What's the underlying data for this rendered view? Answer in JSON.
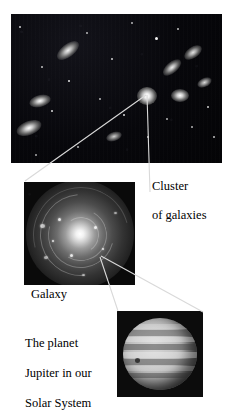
{
  "figure": {
    "type": "nested-zoom-astronomy-diagram",
    "background_color": "#ffffff",
    "panels": [
      {
        "id": "cluster",
        "name": "galaxy-cluster-image",
        "caption": "Cluster\nof galaxies",
        "description": "Dark deep-sky field containing many faint stars and fuzzy elliptical galaxies",
        "background_color": "#050508"
      },
      {
        "id": "galaxy",
        "name": "spiral-galaxy-image",
        "caption": "Galaxy",
        "description": "Face-on spiral galaxy with bright core and winding spiral arms",
        "background_color": "#0a0a0a"
      },
      {
        "id": "jupiter",
        "name": "jupiter-image",
        "caption": "The planet\nJupiter in our\nSolar System",
        "description": "Grayscale disk of Jupiter showing horizontal cloud bands",
        "background_color": "#0c0c0c"
      }
    ]
  },
  "captions": {
    "cluster_line1": "Cluster",
    "cluster_line2": "of galaxies",
    "galaxy": "Galaxy",
    "jupiter_line1": "The planet",
    "jupiter_line2": "Jupiter in our",
    "jupiter_line3": "Solar System"
  },
  "connectors": [
    {
      "name": "cluster-to-galaxy-connector",
      "from": "bright galaxy in cluster field",
      "to": "spiral galaxy panel",
      "color": "#d9d9d9"
    },
    {
      "name": "galaxy-to-jupiter-connector",
      "from": "core of spiral galaxy",
      "to": "jupiter panel",
      "color": "#d9d9d9"
    }
  ],
  "colors": {
    "page_background": "#ffffff",
    "text": "#000000",
    "connector_line": "#d9d9d9",
    "space_black": "#050508"
  }
}
